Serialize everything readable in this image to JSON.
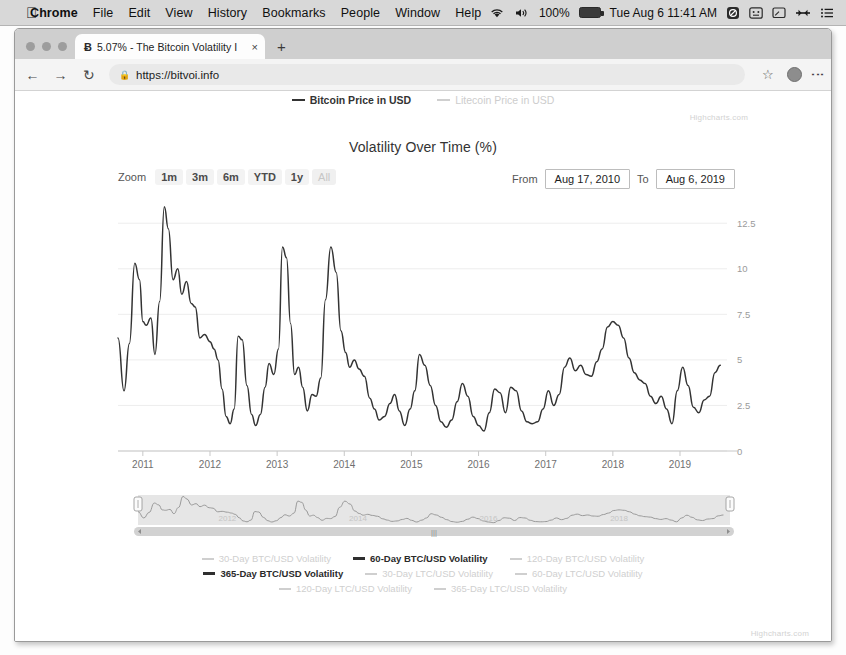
{
  "menubar": {
    "apple_icon": "apple-logo",
    "items": [
      "Chrome",
      "File",
      "Edit",
      "View",
      "History",
      "Bookmarks",
      "People",
      "Window",
      "Help"
    ],
    "app_name": "Chrome",
    "status": {
      "wifi_icon": "wifi-icon",
      "volume_icon": "volume-icon",
      "battery_percent": "100%",
      "battery_icon": "battery-icon",
      "datetime": "Tue Aug 6 11:41 AM",
      "spotlight_icon": "spotlight-icon",
      "controlcenter_icon": "control-center-icon",
      "screen_icon": "screen-mirroring-icon",
      "display_icon": "display-icon",
      "menu_icon": "notification-center-icon"
    }
  },
  "browser": {
    "tab": {
      "favicon": "Ƀ",
      "title": "5.07% - The Bitcoin Volatility I",
      "close_label": "×"
    },
    "newtab_label": "+",
    "back_label": "←",
    "forward_label": "→",
    "reload_label": "↻",
    "lock_icon": "lock-icon",
    "url": "https://bitvoi.info",
    "star_label": "☆",
    "avatar_name": "profile-avatar",
    "menu_label": "⋮"
  },
  "page": {
    "top_legend": [
      {
        "label": "Bitcoin Price in USD",
        "active": true
      },
      {
        "label": "Litecoin Price in USD",
        "active": false
      }
    ],
    "watermark_top": "Highcharts.com",
    "watermark_bottom": "Highcharts.com",
    "range_selector": {
      "zoom_label": "Zoom",
      "buttons": [
        "1m",
        "3m",
        "6m",
        "YTD",
        "1y",
        "All"
      ],
      "selected": "All",
      "from_label": "From",
      "from_value": "Aug 17, 2010",
      "to_label": "To",
      "to_value": "Aug 6, 2019"
    },
    "bottom_legend": [
      {
        "label": "30-Day BTC/USD Volatility",
        "active": false
      },
      {
        "label": "60-Day BTC/USD Volatility",
        "active": true
      },
      {
        "label": "120-Day BTC/USD Volatility",
        "active": false
      },
      {
        "label": "365-Day BTC/USD Volatility",
        "active": true
      },
      {
        "label": "30-Day LTC/USD Volatility",
        "active": false
      },
      {
        "label": "60-Day LTC/USD Volatility",
        "active": false
      },
      {
        "label": "120-Day LTC/USD Volatility",
        "active": false
      },
      {
        "label": "365-Day LTC/USD Volatility",
        "active": false
      }
    ]
  },
  "chart_data": {
    "type": "line",
    "title": "Volatility Over Time (%)",
    "xlabel": "",
    "ylabel": "",
    "grid": true,
    "legend_position": "bottom",
    "y_axis_side": "right",
    "ylim": [
      0,
      13.5
    ],
    "yticks": [
      0,
      2.5,
      5,
      7.5,
      10,
      12.5
    ],
    "ytick_labels": [
      "0",
      "2.5",
      "5",
      "7.5",
      "10",
      "12.5"
    ],
    "xlim": [
      "2010-08-17",
      "2019-08-06"
    ],
    "xticks": [
      "2011",
      "2012",
      "2013",
      "2014",
      "2015",
      "2016",
      "2017",
      "2018",
      "2019"
    ],
    "line_color": "#333333",
    "series": [
      {
        "name": "60-Day BTC/USD Volatility",
        "x": [
          2010.63,
          2010.72,
          2010.8,
          2010.88,
          2010.95,
          2011.0,
          2011.05,
          2011.12,
          2011.18,
          2011.25,
          2011.32,
          2011.38,
          2011.45,
          2011.52,
          2011.58,
          2011.65,
          2011.72,
          2011.78,
          2011.85,
          2011.92,
          2012.0,
          2012.06,
          2012.12,
          2012.18,
          2012.24,
          2012.3,
          2012.36,
          2012.42,
          2012.48,
          2012.55,
          2012.62,
          2012.68,
          2012.75,
          2012.82,
          2012.88,
          2012.95,
          2013.02,
          2013.08,
          2013.14,
          2013.2,
          2013.26,
          2013.32,
          2013.38,
          2013.45,
          2013.52,
          2013.58,
          2013.65,
          2013.72,
          2013.8,
          2013.88,
          2013.95,
          2014.02,
          2014.08,
          2014.15,
          2014.22,
          2014.3,
          2014.38,
          2014.45,
          2014.52,
          2014.6,
          2014.68,
          2014.75,
          2014.82,
          2014.9,
          2014.98,
          2015.05,
          2015.12,
          2015.2,
          2015.28,
          2015.36,
          2015.44,
          2015.52,
          2015.6,
          2015.68,
          2015.76,
          2015.84,
          2015.92,
          2016.0,
          2016.08,
          2016.16,
          2016.24,
          2016.32,
          2016.4,
          2016.48,
          2016.56,
          2016.64,
          2016.72,
          2016.8,
          2016.88,
          2016.96,
          2017.04,
          2017.12,
          2017.2,
          2017.28,
          2017.36,
          2017.44,
          2017.52,
          2017.6,
          2017.68,
          2017.76,
          2017.84,
          2017.92,
          2018.0,
          2018.08,
          2018.16,
          2018.24,
          2018.32,
          2018.4,
          2018.48,
          2018.56,
          2018.64,
          2018.72,
          2018.8,
          2018.88,
          2018.96,
          2019.04,
          2019.12,
          2019.2,
          2019.28,
          2019.36,
          2019.44,
          2019.52,
          2019.6
        ],
        "values": [
          6.2,
          3.3,
          5.9,
          10.3,
          9.4,
          7.1,
          6.9,
          7.3,
          5.3,
          8.2,
          13.4,
          12.2,
          9.4,
          10.0,
          8.6,
          9.3,
          8.1,
          7.9,
          6.2,
          6.4,
          6.0,
          5.6,
          5.0,
          3.4,
          1.9,
          1.5,
          2.3,
          6.3,
          6.1,
          3.6,
          2.0,
          1.4,
          2.0,
          3.5,
          4.8,
          4.2,
          5.6,
          11.2,
          10.6,
          7.0,
          4.2,
          4.6,
          3.5,
          2.2,
          3.1,
          3.0,
          4.0,
          8.3,
          11.2,
          9.8,
          6.6,
          5.4,
          4.6,
          5.0,
          4.5,
          4.1,
          2.9,
          2.3,
          1.7,
          1.9,
          2.6,
          3.1,
          2.2,
          1.4,
          2.3,
          3.3,
          5.3,
          4.7,
          3.6,
          2.5,
          1.6,
          1.3,
          1.7,
          2.7,
          3.7,
          3.0,
          1.9,
          1.4,
          1.1,
          2.1,
          3.4,
          3.2,
          2.1,
          3.5,
          3.3,
          2.2,
          1.6,
          1.5,
          1.6,
          2.3,
          3.3,
          2.5,
          3.1,
          4.6,
          5.1,
          4.4,
          4.7,
          4.2,
          4.1,
          4.9,
          5.6,
          6.8,
          7.1,
          6.9,
          6.2,
          5.1,
          4.3,
          3.9,
          3.7,
          3.0,
          2.6,
          3.0,
          2.3,
          1.5,
          3.3,
          4.6,
          3.6,
          2.4,
          2.1,
          2.8,
          3.0,
          4.3,
          4.7
        ]
      }
    ],
    "navigator": {
      "visible": true,
      "label_years": [
        "2012",
        "2014",
        "2016",
        "2018"
      ],
      "selection": "full-range"
    }
  }
}
